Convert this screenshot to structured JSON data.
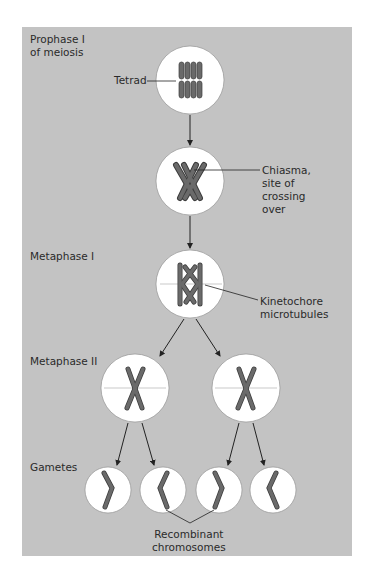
{
  "diagram": {
    "stages": [
      {
        "label": "Prophase I\nof meiosis"
      },
      {
        "label": "Metaphase I"
      },
      {
        "label": "Metaphase II"
      },
      {
        "label": "Gametes"
      }
    ],
    "callouts": {
      "tetrad": "Tetrad",
      "chiasma": "Chiasma,\nsite of\ncrossing\nover",
      "kinetochore": "Kinetochore\nmicrotubules",
      "recombinant": "Recombinant\nchromosomes"
    },
    "colors": {
      "panel": "#c3c3c3",
      "cell": "#ffffff",
      "chromosome": "#6a6a6a",
      "chromosome_outline": "#3c3c3c",
      "line": "#222222"
    }
  }
}
